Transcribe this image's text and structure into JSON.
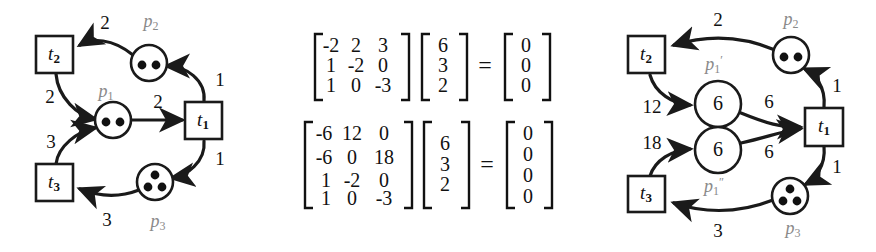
{
  "figure": {
    "colors": {
      "ink": "#111111",
      "place_label": "#8a8a8a",
      "background": "#ffffff"
    }
  },
  "left_net": {
    "caption": "original petri net",
    "transitions": [
      {
        "id": "t1",
        "base": "t",
        "sub": "1"
      },
      {
        "id": "t2",
        "base": "t",
        "sub": "2"
      },
      {
        "id": "t3",
        "base": "t",
        "sub": "3"
      }
    ],
    "places": [
      {
        "id": "p1",
        "base": "p",
        "sub": "1",
        "tokens": 2
      },
      {
        "id": "p2",
        "base": "p",
        "sub": "2",
        "tokens": 2
      },
      {
        "id": "p3",
        "base": "p",
        "sub": "3",
        "tokens": 3
      }
    ],
    "arc_weights": {
      "p2_to_t2": "2",
      "t2_to_p1": "2",
      "p1_to_t1": "2",
      "t1_to_p2": "1",
      "t1_to_p3": "1",
      "p3_to_t3": "3",
      "t3_to_p1": "3"
    }
  },
  "right_net": {
    "caption": "reduced petri net",
    "transitions": [
      {
        "id": "t1",
        "base": "t",
        "sub": "1"
      },
      {
        "id": "t2",
        "base": "t",
        "sub": "2"
      },
      {
        "id": "t3",
        "base": "t",
        "sub": "3"
      }
    ],
    "places": [
      {
        "id": "p2",
        "base": "p",
        "sub": "2",
        "tokens": 2
      },
      {
        "id": "p3",
        "base": "p",
        "sub": "3",
        "tokens": 3
      },
      {
        "id": "p1prime",
        "base": "p",
        "sub": "1",
        "prime": "′",
        "value": "6"
      },
      {
        "id": "p1dprime",
        "base": "p",
        "sub": "1",
        "prime": "″",
        "value": "6"
      }
    ],
    "arc_weights": {
      "p2_to_t2": "2",
      "t2_to_p1prime": "12",
      "p1prime_to_t1": "6",
      "t1_to_p2": "1",
      "t1_to_p3": "1",
      "p3_to_t3": "3",
      "t3_to_p1dprime": "18",
      "p1dprime_to_t1": "6"
    }
  },
  "equations": [
    {
      "id": "equation-1",
      "matrix": [
        [
          "-2",
          "2",
          "3"
        ],
        [
          "1",
          "-2",
          "0"
        ],
        [
          "1",
          "0",
          "-3"
        ]
      ],
      "vector": [
        "6",
        "3",
        "2"
      ],
      "operator": "=",
      "result": [
        "0",
        "0",
        "0"
      ]
    },
    {
      "id": "equation-2",
      "matrix": [
        [
          "-6",
          "12",
          "0"
        ],
        [
          "-6",
          "0",
          "18"
        ],
        [
          "1",
          "-2",
          "0"
        ],
        [
          "1",
          "0",
          "-3"
        ]
      ],
      "vector": [
        "6",
        "3",
        "2"
      ],
      "operator": "=",
      "result": [
        "0",
        "0",
        "0",
        "0"
      ]
    }
  ]
}
